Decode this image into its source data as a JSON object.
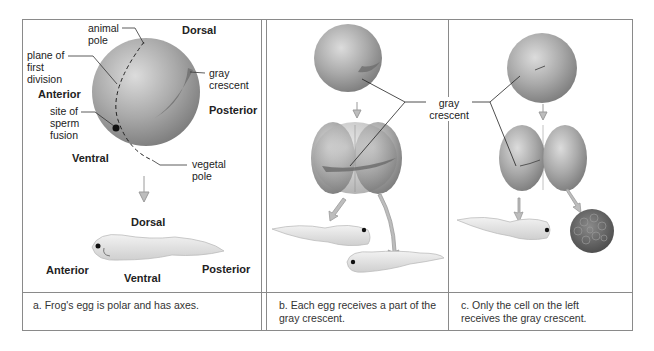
{
  "panels": [
    {
      "id": "a",
      "labels": {
        "animal_pole": "animal\npole",
        "plane_of_first_division": "plane of\nfirst\ndivision",
        "site_of_sperm_fusion": "site of\nsperm\nfusion",
        "vegetal_pole": "vegetal\npole",
        "gray_crescent": "gray\ncrescent",
        "dorsal_top": "Dorsal",
        "anterior_top": "Anterior",
        "posterior_top": "Posterior",
        "ventral_top": "Ventral",
        "dorsal_bottom": "Dorsal",
        "anterior_bottom": "Anterior",
        "ventral_bottom": "Ventral",
        "posterior_bottom": "Posterior"
      },
      "caption": "a. Frog's egg is polar and has axes."
    },
    {
      "id": "b",
      "caption": "b. Each egg receives a part of the\n   gray crescent."
    },
    {
      "id": "c",
      "caption": "c. Only the cell on the left\n   receives the gray crescent."
    }
  ],
  "shared_label": "gray\ncrescent",
  "colors": {
    "frame": "#8a8a8a",
    "egg": "#a8a8a8",
    "crescent": "#6e6e6e",
    "arrow": "#bdbdbd",
    "tadpole": "#e4e4e4"
  }
}
